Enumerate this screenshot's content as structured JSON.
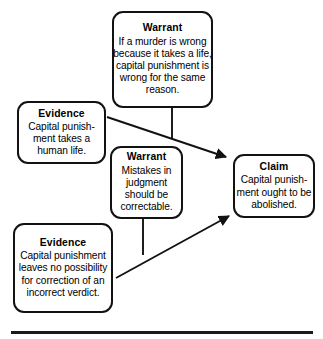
{
  "diagram": {
    "type": "argument-map",
    "nodes": [
      {
        "id": "warrant-top",
        "role": "Warrant",
        "title": "Warrant",
        "lines": [
          "If a murder is wrong",
          "because it takes a life,",
          "capital punishment is",
          "wrong for the same",
          "reason."
        ],
        "text": "If a murder is wrong because it takes a life, capital punishment is wrong for the same reason."
      },
      {
        "id": "evidence-life",
        "role": "Evidence",
        "title": "Evidence",
        "lines": [
          "Capital punish-",
          "ment takes a",
          "human life."
        ],
        "text": "Capital punishment takes a human life."
      },
      {
        "id": "warrant-mistakes",
        "role": "Warrant",
        "title": "Warrant",
        "lines": [
          "Mistakes in",
          "judgment",
          "should be",
          "correctable."
        ],
        "text": "Mistakes in judgment should be correctable."
      },
      {
        "id": "claim",
        "role": "Claim",
        "title": "Claim",
        "lines": [
          "Capital punish-",
          "ment ought to be",
          "abolished."
        ],
        "text": "Capital punishment ought to be abolished."
      },
      {
        "id": "evidence-verdict",
        "role": "Evidence",
        "title": "Evidence",
        "lines": [
          "Capital punishment",
          "leaves no possibility",
          "for correction of an",
          "incorrect verdict."
        ],
        "text": "Capital punishment leaves no possibility for correction of an incorrect verdict."
      }
    ],
    "edges": [
      {
        "id": "edge-evidence-life-to-claim",
        "from": "evidence-life",
        "to": "claim",
        "arrow": true
      },
      {
        "id": "edge-warrant-top-to-link",
        "from": "warrant-top",
        "to": "edge-evidence-life-to-claim",
        "arrow": false
      },
      {
        "id": "edge-evidence-verdict-to-claim",
        "from": "evidence-verdict",
        "to": "claim",
        "arrow": true
      },
      {
        "id": "edge-warrant-mistakes-to-link",
        "from": "warrant-mistakes",
        "to": "edge-evidence-verdict-to-claim",
        "arrow": false
      }
    ],
    "colors": {
      "stroke": "#121212",
      "background": "#ffffff",
      "text": "#000000",
      "rule": "#1a1a1a"
    }
  }
}
